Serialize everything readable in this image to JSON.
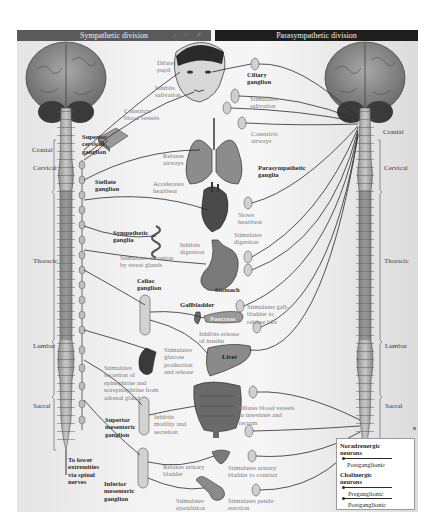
{
  "headers": {
    "sympathetic": "Sympathetic division",
    "parasympathetic": "Parasympathetic division",
    "toolbar_icons": [
      "zoom-out-icon",
      "equals-icon",
      "share-icon"
    ]
  },
  "spinal_regions": {
    "left": [
      "Cranial",
      "Cervical",
      "Thoracic",
      "Lumbar",
      "Sacral"
    ],
    "right": [
      "Cranial",
      "Cervical",
      "Thoracic",
      "Lumbar",
      "Sacral"
    ]
  },
  "sympathetic_ganglia": {
    "superior_cervical": "Superior\ncervical\nganglion",
    "stellate": "Stellate\nganglion",
    "sympathetic_ganglia": "Sympathetic\nganglia",
    "celiac": "Celiac\nganglion",
    "superior_mesenteric": "Superior\nmesenteric\nganglion",
    "inferior_mesenteric": "Inferior\nmesenteric\nganglion",
    "lower_extremities": "To lower\nextremities\nvia spinal\nnerves"
  },
  "parasympathetic_ganglia": {
    "ciliary": "Ciliary\nganglion",
    "parasympathetic": "Parasympathetic\nganglia"
  },
  "organs": {
    "stomach": "Stomach",
    "gallbladder": "Gallbladder",
    "pancreas": "Pancreas",
    "liver": "Liver"
  },
  "sympathetic_effects": {
    "dilates_pupil": "Dilates\npupil",
    "inhibits_salivation": "Inhibits\nsalivation",
    "constricts_vessels": "Constricts\nblood vessels",
    "relaxes_airways": "Relaxes\nairways",
    "accelerates_heartbeat": "Accelerates\nheartbeat",
    "sweat_glands": "Stimulates secretion\nby sweat glands",
    "inhibits_digestion": "Inhibits\ndigestion",
    "glucose": "Stimulates\nglucose\nproduction\nand release",
    "adrenal": "Stimulates\nsecretion of\nepinephrine and\nnorepinephrine from\nadrenal gland",
    "inhibits_motility": "Inhibits\nmotility and\nsecretion",
    "relaxes_bladder": "Relaxes urinary\nbladder",
    "ejaculation": "Stimulates\nejaculation"
  },
  "parasympathetic_effects": {
    "stimulates_salivation": "Stimulates\nsalivation",
    "constricts_airways": "Constricts\nairways",
    "slows_heartbeat": "Slows\nheartbeat",
    "stimulates_digestion": "Stimulates\ndigestion",
    "gallbladder_bile": "Stimulates gall-\nbladder to\nrelease bile",
    "inhibits_insulin": "Inhibits release\nof insulin",
    "dilates_vessels": "Dilates blood vessels\nin intestines and\nrectum",
    "contracts_bladder": "Stimulates urinary\nbladder to contract",
    "penile_erection": "Stimulates penile\nerection"
  },
  "legend": {
    "noradrenergic_title": "Noradrenergic\nneurons",
    "noradrenergic_post": "Postganglionic",
    "cholinergic_title": "Cholinergic\nneurons",
    "cholinergic_pre": "Preganglionic",
    "cholinergic_post": "Postganglionic"
  },
  "colors": {
    "sympathetic_header": "#5a5a5a",
    "parasympathetic_header": "#1e1e1e",
    "effect_text": "#7a7a7a",
    "label_text": "#2c2c2c",
    "nerve_line": "#2a2a2a"
  }
}
